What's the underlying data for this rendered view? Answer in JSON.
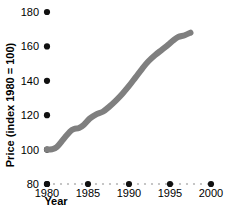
{
  "chart_data": {
    "type": "line",
    "title": "",
    "subtitle": "",
    "xlabel": "Year",
    "ylabel": "Price (index 1980 = 100)",
    "xlim": [
      1980,
      2000
    ],
    "ylim": [
      80,
      180
    ],
    "grid": false,
    "legend": null,
    "legend_position": "none",
    "axis": {
      "x_ticks": [
        1980,
        1985,
        1990,
        1995,
        2000
      ],
      "x_tick_labels": [
        "1980",
        "1985",
        "1990",
        "1995",
        "2000"
      ],
      "y_ticks": [
        80,
        100,
        120,
        140,
        160,
        180
      ],
      "y_tick_labels": [
        "80",
        "100",
        "120",
        "140",
        "160",
        "180"
      ],
      "x_tick_style": "filled-dot",
      "y_tick_style": "filled-dot",
      "x_axis_line_style": "dotted",
      "y_axis_line_style": "none"
    },
    "series": [
      {
        "name": "Price index",
        "color": "#7f7f7f",
        "line_width": 6,
        "x": [
          1980.0,
          1980.6,
          1981.2,
          1982.0,
          1982.8,
          1983.3,
          1983.9,
          1984.5,
          1985.2,
          1986.0,
          1986.8,
          1987.6,
          1988.4,
          1989.2,
          1990.0,
          1990.8,
          1991.6,
          1992.4,
          1993.2,
          1994.0,
          1994.8,
          1995.4,
          1996.0,
          1996.8,
          1997.5
        ],
        "y": [
          100.0,
          100.2,
          101.5,
          106.0,
          110.5,
          112.0,
          112.5,
          114.5,
          118.0,
          120.5,
          122.0,
          125.0,
          128.5,
          132.5,
          137.0,
          142.0,
          147.0,
          151.5,
          155.0,
          158.0,
          161.0,
          163.5,
          165.5,
          166.5,
          168.0
        ]
      }
    ],
    "colors": {
      "line": "#7f7f7f",
      "tick_dot": "#111111",
      "grid_dot": "#b8b8b8",
      "text": "#000000",
      "background": "#ffffff"
    }
  }
}
